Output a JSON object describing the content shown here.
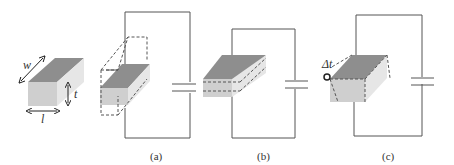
{
  "figure": {
    "dimension_labels": {
      "width": "w",
      "thickness": "t",
      "length": "l"
    },
    "panels": [
      {
        "id": "a",
        "label": "(a)"
      },
      {
        "id": "b",
        "label": "(b)"
      },
      {
        "id": "c",
        "label": "(c)"
      }
    ],
    "delta_label": "Δt",
    "colors": {
      "top_face": "#8e8e8e",
      "front_face": "#cfcfcf",
      "side_face": "#e6e6e6",
      "wire": "#555555"
    }
  }
}
